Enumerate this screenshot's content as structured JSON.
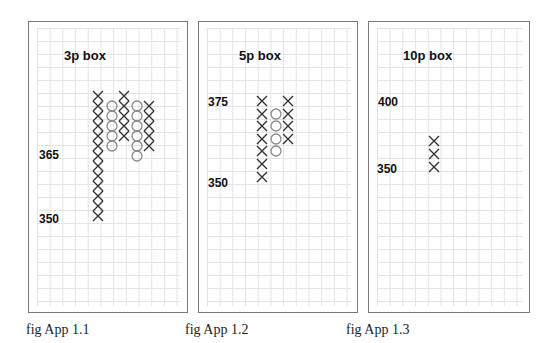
{
  "figures": [
    {
      "caption": "fig App 1.1",
      "box_label": "3p box",
      "price_labels": [
        {
          "text": "365"
        },
        {
          "text": "350"
        }
      ]
    },
    {
      "caption": "fig App 1.2",
      "box_label": "5p box",
      "price_labels": [
        {
          "text": "375"
        },
        {
          "text": "350"
        }
      ]
    },
    {
      "caption": "fig App 1.3",
      "box_label": "10p box",
      "price_labels": [
        {
          "text": "400"
        },
        {
          "text": "350"
        }
      ]
    }
  ],
  "colors": {
    "x_mark": "#333333",
    "o_mark": "#8a8a8a",
    "grid": "#e4e4e4",
    "border": "#7a7a7a"
  },
  "chart_data": [
    {
      "type": "point-and-figure",
      "title": "3p box",
      "box_size": 3,
      "ytick_labels": [
        "365",
        "350"
      ],
      "columns": [
        {
          "type": "X",
          "count": 13,
          "high": 383,
          "low": 347
        },
        {
          "type": "O",
          "count": 5,
          "high": 380,
          "low": 368
        },
        {
          "type": "X",
          "count": 5,
          "high": 383,
          "low": 371
        },
        {
          "type": "O",
          "count": 6,
          "high": 380,
          "low": 365
        },
        {
          "type": "X",
          "count": 5,
          "high": 380,
          "low": 368
        }
      ],
      "caption": "fig App 1.1"
    },
    {
      "type": "point-and-figure",
      "title": "5p box",
      "box_size": 5,
      "ytick_labels": [
        "375",
        "350"
      ],
      "columns": [
        {
          "type": "X",
          "count": 7,
          "high": 375,
          "low": 345
        },
        {
          "type": "O",
          "count": 4,
          "high": 370,
          "low": 355
        },
        {
          "type": "X",
          "count": 4,
          "high": 375,
          "low": 360
        }
      ],
      "caption": "fig App 1.2"
    },
    {
      "type": "point-and-figure",
      "title": "10p box",
      "box_size": 10,
      "ytick_labels": [
        "400",
        "350"
      ],
      "columns": [
        {
          "type": "X",
          "count": 3,
          "high": 370,
          "low": 350
        }
      ],
      "caption": "fig App 1.3"
    }
  ]
}
